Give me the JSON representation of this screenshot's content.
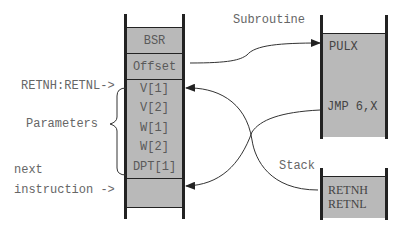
{
  "main_column": {
    "cells": [
      "BSR",
      "Offset"
    ],
    "parameters": [
      "V[1]",
      "V[2]",
      "W[1]",
      "W[2]",
      "DPT[1]",
      "DPT[2]"
    ],
    "next_cell": ""
  },
  "labels": {
    "retn_pointer": "RETNH:RETNL->",
    "parameters": "Parameters",
    "next": "next",
    "instruction": "instruction ->",
    "subroutine": "Subroutine",
    "stack": "Stack"
  },
  "subroutine": {
    "lines": [
      "PULX",
      "JMP 6,X"
    ]
  },
  "stack": {
    "lines": [
      "RETNH",
      "RETNL"
    ]
  },
  "colors": {
    "fill": "#b9b9b9",
    "line": "#222222",
    "text": "#666666"
  }
}
